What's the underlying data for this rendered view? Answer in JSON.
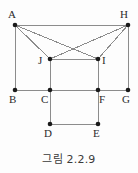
{
  "figure": {
    "caption": "그림 2.2.9",
    "line_color": "#8c8c8c",
    "vertex_color": "#1a1a1a",
    "label_color": "#2b2b2b",
    "background_color": "#fdfdfd",
    "width": 138,
    "height": 173
  },
  "vertices": [
    {
      "id": "A",
      "label": "A",
      "x": 15,
      "y": 25,
      "label_x": 8,
      "label_y": 9
    },
    {
      "id": "H",
      "label": "H",
      "x": 128,
      "y": 25,
      "label_x": 120,
      "label_y": 9
    },
    {
      "id": "J",
      "label": "J",
      "x": 50,
      "y": 59,
      "label_x": 38,
      "label_y": 55
    },
    {
      "id": "I",
      "label": "I",
      "x": 98,
      "y": 59,
      "label_x": 102,
      "label_y": 55
    },
    {
      "id": "B",
      "label": "B",
      "x": 15,
      "y": 90,
      "label_x": 9,
      "label_y": 94
    },
    {
      "id": "C",
      "label": "C",
      "x": 50,
      "y": 90,
      "label_x": 41,
      "label_y": 94
    },
    {
      "id": "F",
      "label": "F",
      "x": 98,
      "y": 90,
      "label_x": 99,
      "label_y": 94
    },
    {
      "id": "G",
      "label": "G",
      "x": 128,
      "y": 90,
      "label_x": 122,
      "label_y": 94
    },
    {
      "id": "D",
      "label": "D",
      "x": 50,
      "y": 124,
      "label_x": 44,
      "label_y": 128
    },
    {
      "id": "E",
      "label": "E",
      "x": 98,
      "y": 124,
      "label_x": 93,
      "label_y": 128
    }
  ],
  "edges": [
    {
      "from": "A",
      "to": "H",
      "name": "edge-A-H"
    },
    {
      "from": "A",
      "to": "B",
      "name": "edge-A-B"
    },
    {
      "from": "H",
      "to": "G",
      "name": "edge-H-G"
    },
    {
      "from": "B",
      "to": "G",
      "name": "edge-B-G"
    },
    {
      "from": "J",
      "to": "I",
      "name": "edge-J-I"
    },
    {
      "from": "J",
      "to": "D",
      "name": "edge-J-D"
    },
    {
      "from": "I",
      "to": "E",
      "name": "edge-I-E"
    },
    {
      "from": "D",
      "to": "E",
      "name": "edge-D-E"
    },
    {
      "from": "A",
      "to": "J",
      "name": "edge-A-J"
    },
    {
      "from": "A",
      "to": "I",
      "name": "edge-A-I"
    },
    {
      "from": "H",
      "to": "J",
      "name": "edge-H-J"
    },
    {
      "from": "H",
      "to": "I",
      "name": "edge-H-I"
    }
  ]
}
